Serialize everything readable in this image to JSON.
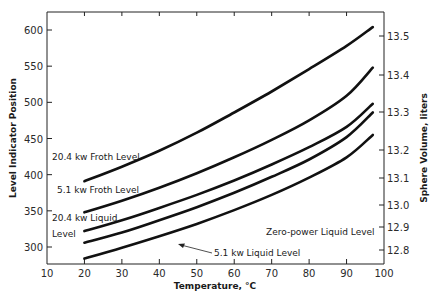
{
  "chart_data": {
    "type": "line",
    "title": "",
    "xlabel": "Temperature, °C",
    "ylabel": "Level Indicator Position",
    "y2label": "Sphere Volume, liters",
    "xlim": [
      10,
      100
    ],
    "ylim": [
      275,
      625
    ],
    "x_ticks": [
      10,
      20,
      30,
      40,
      50,
      60,
      70,
      80,
      90,
      100
    ],
    "y_ticks": [
      300,
      350,
      400,
      450,
      500,
      550,
      600
    ],
    "y2_ticks": [
      "13.5",
      "13.4",
      "13.3",
      "13.2",
      "13.1",
      "13.0",
      "12.9",
      "12.8"
    ],
    "grid": false,
    "legend": "inline annotations",
    "x": [
      20,
      30,
      40,
      50,
      60,
      70,
      80,
      90,
      97
    ],
    "series": [
      {
        "name": "20.4 kw Froth Level",
        "values": [
          391,
          411,
          433,
          458,
          486,
          515,
          546,
          578,
          604
        ]
      },
      {
        "name": "5.1 kw Froth Level",
        "values": [
          348,
          364,
          382,
          402,
          424,
          448,
          475,
          509,
          548
        ]
      },
      {
        "name": "20.4 kw Liquid Level",
        "values": [
          322,
          337,
          354,
          372,
          392,
          414,
          438,
          466,
          498
        ]
      },
      {
        "name": "5.1 kw Liquid Level",
        "values": [
          306,
          320,
          337,
          355,
          375,
          397,
          421,
          452,
          486
        ]
      },
      {
        "name": "Zero-power Liquid Level",
        "values": [
          284,
          299,
          315,
          332,
          351,
          372,
          396,
          424,
          455
        ]
      }
    ],
    "annotations": [
      "20.4 kw Froth Level",
      "5.1 kw Froth Level",
      "20.4 kw Liquid",
      "Level",
      "Zero-power Liquid Level",
      "5.1 kw Liquid Level"
    ]
  }
}
